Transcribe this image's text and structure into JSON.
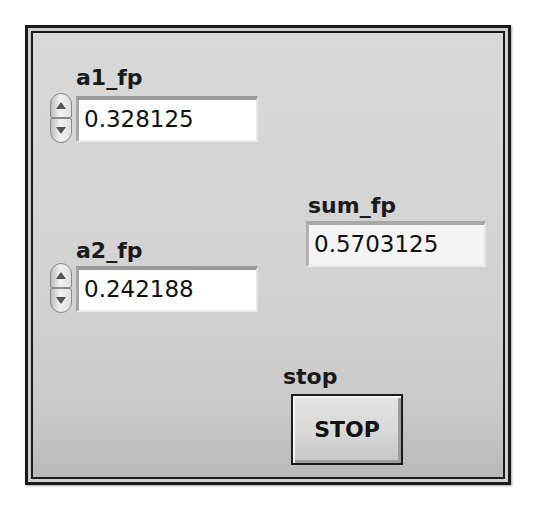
{
  "front_panel": {
    "controls": {
      "a1_fp": {
        "label": "a1_fp",
        "value": "0.328125"
      },
      "a2_fp": {
        "label": "a2_fp",
        "value": "0.242188"
      }
    },
    "indicators": {
      "sum_fp": {
        "label": "sum_fp",
        "value": "0.5703125"
      }
    },
    "stop": {
      "label": "stop",
      "button_text": "STOP"
    },
    "icons": {
      "increment": "spin-up-arrow",
      "decrement": "spin-down-arrow"
    },
    "colors": {
      "panel_background": "#d4d4d4",
      "frame": "#1a1a1a",
      "control_field": "#ffffff",
      "indicator_field": "#f4f4f4"
    }
  }
}
